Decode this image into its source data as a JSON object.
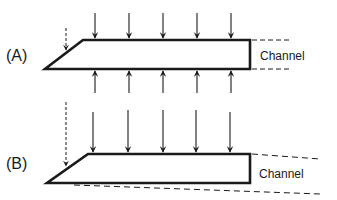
{
  "panels": [
    {
      "id": "A",
      "label": "(A)",
      "channel_label": "Channel",
      "description": "Uniform pressure from both sides; channel edges parallel"
    },
    {
      "id": "B",
      "label": "(B)",
      "channel_label": "Channel",
      "description": "Pressure from top only; channel edges diverging"
    }
  ],
  "colors": {
    "stroke": "#1a1a1a",
    "background": "#ffffff"
  }
}
